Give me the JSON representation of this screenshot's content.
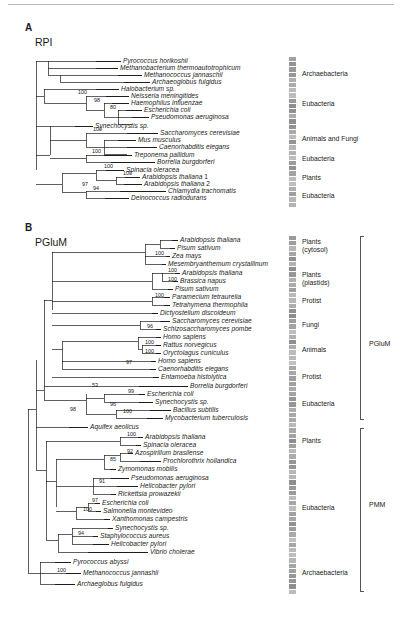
{
  "figure": {
    "top_rule": true,
    "panels": [
      {
        "letter": "A",
        "name": "RPI",
        "taxa": [
          {
            "label": "Pyrococcus horikoshii",
            "y": 61,
            "x": 123,
            "tip_x": 96
          },
          {
            "label": "Methanobacterium thermoautotrophicum",
            "y": 68,
            "x": 120,
            "tip_x": 96
          },
          {
            "label": "Methanococcus jannaschii",
            "y": 75,
            "x": 144,
            "tip_x": 118
          },
          {
            "label": "Archaeoglobus fulgidus",
            "y": 82,
            "x": 152,
            "tip_x": 124
          },
          {
            "label": "Halobacterium sp.",
            "y": 89,
            "x": 121,
            "tip_x": 96
          },
          {
            "label": "Neisseria meningitides",
            "y": 96,
            "x": 131,
            "tip_x": 106
          },
          {
            "label": "Haemophilus influenzae",
            "y": 103,
            "x": 131,
            "tip_x": 112
          },
          {
            "label": "Escherichia coli",
            "y": 110,
            "x": 144,
            "tip_x": 126
          },
          {
            "label": "Pseudomonas aeruginosa",
            "y": 117,
            "x": 151,
            "tip_x": 132
          },
          {
            "label": "Synechocystis sp.",
            "y": 126,
            "x": 95,
            "tip_x": 75
          },
          {
            "label": "Saccharomyces cerevisiae",
            "y": 133,
            "x": 160,
            "tip_x": 127
          },
          {
            "label": "Mus musculus",
            "y": 140,
            "x": 138,
            "tip_x": 118
          },
          {
            "label": "Caenorhabditis elegans",
            "y": 147,
            "x": 159,
            "tip_x": 127
          },
          {
            "label": "Treponema pallidum",
            "y": 155,
            "x": 134,
            "tip_x": 104
          },
          {
            "label": "Borrelia burgdorferi",
            "y": 162,
            "x": 157,
            "tip_x": 111
          },
          {
            "label": "Spinacia oleracea",
            "y": 170,
            "x": 126,
            "tip_x": 106
          },
          {
            "label": "Arabidopsis thaliana 1",
            "y": 177,
            "x": 142,
            "tip_x": 125
          },
          {
            "label": "Arabidopsis thaliana 2",
            "y": 184,
            "x": 144,
            "tip_x": 124
          },
          {
            "label": "Chlamydia trachomatis",
            "y": 191,
            "x": 168,
            "tip_x": 120
          },
          {
            "label": "Deinococcus radiodurans",
            "y": 198,
            "x": 131,
            "tip_x": 105
          }
        ],
        "bootstraps": [
          {
            "value": "100",
            "x": 78,
            "y": 92
          },
          {
            "value": "98",
            "x": 94,
            "y": 100
          },
          {
            "value": "80",
            "x": 110,
            "y": 107
          },
          {
            "value": "100",
            "x": 93,
            "y": 129
          },
          {
            "value": "100",
            "x": 92,
            "y": 151
          },
          {
            "value": "97",
            "x": 82,
            "y": 184
          },
          {
            "value": "100",
            "x": 104,
            "y": 166
          },
          {
            "value": "100",
            "x": 123,
            "y": 173
          },
          {
            "value": "94",
            "x": 93,
            "y": 188
          }
        ],
        "groups": [
          {
            "label": "Archaebacteria",
            "y": 74
          },
          {
            "label": "Eubacteria",
            "y": 104
          },
          {
            "label": "Animals and Fungi",
            "y": 139
          },
          {
            "label": "Eubacteria",
            "y": 159
          },
          {
            "label": "Plants",
            "y": 178
          },
          {
            "label": "Eubacteria",
            "y": 196
          }
        ]
      },
      {
        "letter": "B",
        "name": "PGluM",
        "taxa": [
          {
            "label": "Arabidopsis thaliana",
            "y": 240,
            "x": 180,
            "tip_x": 172
          },
          {
            "label": "Pisum sativum",
            "y": 248,
            "x": 177,
            "tip_x": 170
          },
          {
            "label": "Zea mays",
            "y": 256,
            "x": 172,
            "tip_x": 166
          },
          {
            "label": "Mesembryanthemum crystallinum",
            "y": 264,
            "x": 168,
            "tip_x": 162
          },
          {
            "label": "Arabidopsis thaliana",
            "y": 273,
            "x": 182,
            "tip_x": 175
          },
          {
            "label": "Brassica napus",
            "y": 281,
            "x": 180,
            "tip_x": 173
          },
          {
            "label": "Pisum sativum",
            "y": 289,
            "x": 175,
            "tip_x": 168
          },
          {
            "label": "Paramecium tetraurelia",
            "y": 297,
            "x": 172,
            "tip_x": 164
          },
          {
            "label": "Tetrahymena thermophila",
            "y": 305,
            "x": 172,
            "tip_x": 164
          },
          {
            "label": "Dictyostelium discoideum",
            "y": 313,
            "x": 160,
            "tip_x": 152
          },
          {
            "label": "Saccharomyces cerevisiae",
            "y": 321,
            "x": 172,
            "tip_x": 160
          },
          {
            "label": "Schizosaccharomyces pombe",
            "y": 329,
            "x": 163,
            "tip_x": 156
          },
          {
            "label": "Homo sapiens",
            "y": 337,
            "x": 163,
            "tip_x": 156
          },
          {
            "label": "Rattus norvegicus",
            "y": 345,
            "x": 163,
            "tip_x": 156
          },
          {
            "label": "Oryctolagus cuniculus",
            "y": 353,
            "x": 163,
            "tip_x": 156
          },
          {
            "label": "Homo sapiens",
            "y": 361,
            "x": 158,
            "tip_x": 151
          },
          {
            "label": "Caenorhabditis elegans",
            "y": 369,
            "x": 158,
            "tip_x": 150
          },
          {
            "label": "Entamoeba histolytica",
            "y": 377,
            "x": 161,
            "tip_x": 153
          },
          {
            "label": "Borrelia burgdorferi",
            "y": 386,
            "x": 190,
            "tip_x": 139
          },
          {
            "label": "Escherichia coli",
            "y": 394,
            "x": 147,
            "tip_x": 139
          },
          {
            "label": "Synechocystis sp.",
            "y": 402,
            "x": 155,
            "tip_x": 139
          },
          {
            "label": "Bacillus subtilis",
            "y": 410,
            "x": 173,
            "tip_x": 150
          },
          {
            "label": "Mycobacterium tuberculosis",
            "y": 418,
            "x": 165,
            "tip_x": 147
          },
          {
            "label": "Aquifex aeolicus",
            "y": 427,
            "x": 90,
            "tip_x": 69
          },
          {
            "label": "Arabidopsis thaliana",
            "y": 437,
            "x": 145,
            "tip_x": 138
          },
          {
            "label": "Spinacia oleracea",
            "y": 445,
            "x": 143,
            "tip_x": 136
          },
          {
            "label": "Azospirillum brasilense",
            "y": 453,
            "x": 135,
            "tip_x": 128
          },
          {
            "label": "Prochlorothrix hollandica",
            "y": 461,
            "x": 163,
            "tip_x": 140
          },
          {
            "label": "Zymomonas mobilis",
            "y": 469,
            "x": 118,
            "tip_x": 110
          },
          {
            "label": "Pseudomonas aeruginosa",
            "y": 478,
            "x": 131,
            "tip_x": 111
          },
          {
            "label": "Helicobacter pylori",
            "y": 486,
            "x": 140,
            "tip_x": 117
          },
          {
            "label": "Rickettsia prowazekii",
            "y": 494,
            "x": 118,
            "tip_x": 111
          },
          {
            "label": "Escherichia coli",
            "y": 503,
            "x": 102,
            "tip_x": 95
          },
          {
            "label": "Salmonella montevideo",
            "y": 511,
            "x": 103,
            "tip_x": 96
          },
          {
            "label": "Xanthomonas campestris",
            "y": 519,
            "x": 112,
            "tip_x": 104
          },
          {
            "label": "Synechocystis sp.",
            "y": 528,
            "x": 115,
            "tip_x": 108
          },
          {
            "label": "Staphylococcus aureus",
            "y": 536,
            "x": 100,
            "tip_x": 93
          },
          {
            "label": "Helicobacter pylori",
            "y": 544,
            "x": 111,
            "tip_x": 93
          },
          {
            "label": "Vibrio cholerae",
            "y": 552,
            "x": 150,
            "tip_x": 88
          },
          {
            "label": "Pyrococcus abyssi",
            "y": 562,
            "x": 73,
            "tip_x": 55
          },
          {
            "label": "Methanococcus jannashii",
            "y": 573,
            "x": 83,
            "tip_x": 66
          },
          {
            "label": "Archaeglobus fulgidus",
            "y": 584,
            "x": 77,
            "tip_x": 55
          }
        ],
        "bootstraps": [
          {
            "value": "100",
            "x": 155,
            "y": 253
          },
          {
            "value": "100",
            "x": 168,
            "y": 270
          },
          {
            "value": "100",
            "x": 168,
            "y": 279
          },
          {
            "value": "100",
            "x": 155,
            "y": 295
          },
          {
            "value": "96",
            "x": 147,
            "y": 326
          },
          {
            "value": "100",
            "x": 145,
            "y": 342
          },
          {
            "value": "100",
            "x": 145,
            "y": 351
          },
          {
            "value": "97",
            "x": 126,
            "y": 362
          },
          {
            "value": "53",
            "x": 92,
            "y": 385
          },
          {
            "value": "99",
            "x": 128,
            "y": 391
          },
          {
            "value": "96",
            "x": 110,
            "y": 404
          },
          {
            "value": "100",
            "x": 123,
            "y": 411
          },
          {
            "value": "98",
            "x": 70,
            "y": 409
          },
          {
            "value": "100",
            "x": 127,
            "y": 434
          },
          {
            "value": "92",
            "x": 127,
            "y": 451
          },
          {
            "value": "85",
            "x": 110,
            "y": 459
          },
          {
            "value": "91",
            "x": 99,
            "y": 481
          },
          {
            "value": "97",
            "x": 92,
            "y": 500
          },
          {
            "value": "100",
            "x": 83,
            "y": 509
          },
          {
            "value": "94",
            "x": 78,
            "y": 533
          },
          {
            "value": "100",
            "x": 57,
            "y": 570
          }
        ],
        "groups": [
          {
            "label": "Plants",
            "y": 242,
            "sub": "(cytosol)"
          },
          {
            "label": "Plants",
            "y": 275,
            "sub": "(plastids)"
          },
          {
            "label": "Protist",
            "y": 301
          },
          {
            "label": "Fungi",
            "y": 325
          },
          {
            "label": "Animals",
            "y": 350
          },
          {
            "label": "Protist",
            "y": 377
          },
          {
            "label": "Eubacteria",
            "y": 404
          },
          {
            "label": "Plants",
            "y": 441
          },
          {
            "label": "Eubacteria",
            "y": 508
          },
          {
            "label": "Archaebacteria",
            "y": 573
          }
        ],
        "brackets": [
          {
            "label": "PGluM",
            "top": 236,
            "bottom": 420,
            "label_y": 344
          },
          {
            "label": "PMM",
            "top": 428,
            "bottom": 592,
            "label_y": 505
          }
        ]
      }
    ]
  },
  "legend": {
    "gray_bar_color": "#9a9a9a",
    "line_color": "#1d1d1d",
    "bracket_color": "#555555"
  }
}
